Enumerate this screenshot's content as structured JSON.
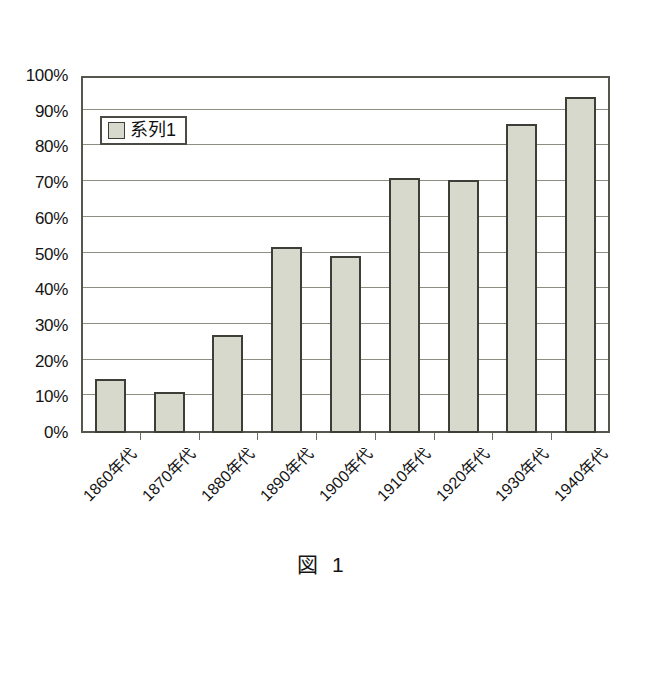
{
  "figure": {
    "caption": "図 1"
  },
  "legend": {
    "swatch_name": "series-swatch",
    "entries": [
      {
        "label": "系列1",
        "color": "#d7d9cd"
      }
    ]
  },
  "axes": {
    "y_tick_labels": [
      "100%",
      "90%",
      "80%",
      "70%",
      "60%",
      "50%",
      "40%",
      "30%",
      "20%",
      "10%",
      "0%"
    ],
    "x_tick_labels": [
      "1860年代",
      "1870年代",
      "1880年代",
      "1890年代",
      "1900年代",
      "1910年代",
      "1920年代",
      "1930年代",
      "1940年代"
    ]
  },
  "colors": {
    "bar_fill": "#d7d9cd",
    "bar_stroke": "#3d3e38",
    "gridline": "#8d8e80",
    "frame": "#55564d",
    "background": "#ffffff"
  },
  "chart_data": {
    "type": "bar",
    "title": "図 1",
    "xlabel": "",
    "ylabel": "",
    "categories": [
      "1860年代",
      "1870年代",
      "1880年代",
      "1890年代",
      "1900年代",
      "1910年代",
      "1920年代",
      "1930年代",
      "1940年代"
    ],
    "values": [
      15,
      11.5,
      27.5,
      52,
      49.5,
      71.5,
      71,
      86.5,
      94
    ],
    "series": [
      {
        "name": "系列1",
        "values": [
          15,
          11.5,
          27.5,
          52,
          49.5,
          71.5,
          71,
          86.5,
          94
        ]
      }
    ],
    "ylim": [
      0,
      100
    ],
    "ytick_step": 10,
    "ytick_format": "percent",
    "grid": true,
    "legend_position": "top-left"
  }
}
